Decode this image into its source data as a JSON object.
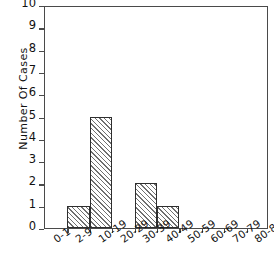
{
  "chart_data": {
    "type": "bar",
    "title": "",
    "xlabel": "",
    "ylabel": "Number Of Cases",
    "categories": [
      "0-1",
      "2-9",
      "10-19",
      "20-29",
      "30-39",
      "40-49",
      "50-59",
      "60-69",
      "70-79",
      "80-89"
    ],
    "values": [
      0,
      1,
      5,
      0,
      2,
      1,
      0,
      0,
      0,
      0
    ],
    "ylim": [
      0,
      10
    ],
    "yticks": [
      "0",
      "1",
      "2",
      "3",
      "4",
      "5",
      "6",
      "7",
      "8",
      "9",
      "10"
    ],
    "grid": false,
    "legend": null,
    "bar_style": "diagonal-hatch",
    "colors": {
      "axis": "#4a4a4a",
      "bar_edge": "#2e2e2e",
      "bar_hatch": "#6f6f6f",
      "text": "#111111",
      "background": "#ffffff"
    }
  }
}
